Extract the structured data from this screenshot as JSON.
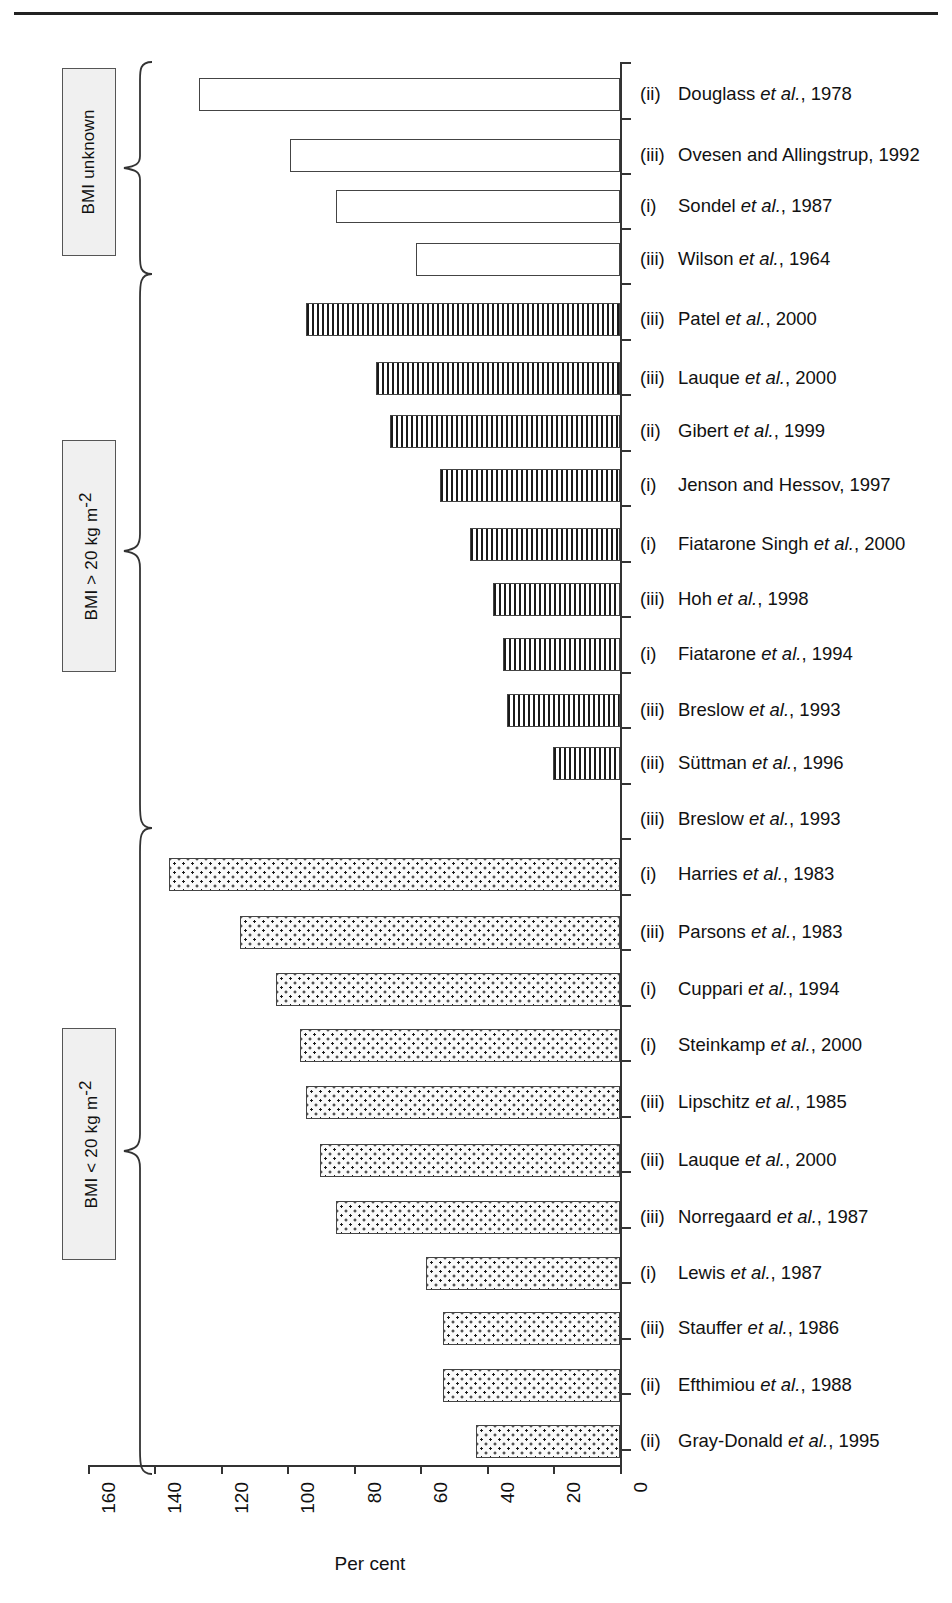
{
  "chart_data": {
    "type": "bar",
    "orientation": "horizontal",
    "title": "",
    "xlabel": "Per cent",
    "ylabel": "",
    "xlim": [
      160,
      0
    ],
    "x_axis_reversed": true,
    "xticks": [
      160,
      140,
      120,
      100,
      80,
      60,
      40,
      20,
      0
    ],
    "xticklabels": [
      "160",
      "140",
      "120",
      "100",
      "80",
      "60",
      "40",
      "20",
      "0"
    ],
    "grid": false,
    "legend": null,
    "groups": [
      {
        "id": "bmi-unknown",
        "label": "BMI unknown",
        "label_html": "BMI unknown",
        "fill": "open",
        "categories": [
          "(ii)  Douglass et al., 1978",
          "(iii) Ovesen and Allingstrup, 1992",
          "(i)   Sondel et al., 1987",
          "(iii) Wilson et al., 1964"
        ],
        "values": [
          126,
          99,
          85,
          61
        ]
      },
      {
        "id": "bmi-over-20",
        "label": "BMI > 20 kg m-2",
        "label_html": "BMI > 20 kg m<sup>-2</sup>",
        "fill": "vertical-lines",
        "categories": [
          "(iii) Patel et al., 2000",
          "(iii) Lauque et al., 2000",
          "(ii)  Gibert et al., 1999",
          "(i)   Jenson and Hessov, 1997",
          "(i)   Fiatarone Singh et al., 2000",
          "(iii) Hoh et al., 1998",
          "(i)   Fiatarone et al., 1994",
          "(iii) Breslow et al., 1993",
          "(iii) Süttman et al., 1996",
          "(iii) Breslow et al., 1993"
        ],
        "values": [
          94,
          73,
          69,
          54,
          45,
          38,
          35,
          34,
          20,
          0
        ]
      },
      {
        "id": "bmi-under-20",
        "label": "BMI < 20 kg m-2",
        "label_html": "BMI < 20 kg m<sup>-2</sup>",
        "fill": "dots",
        "categories": [
          "(i)   Harries et al., 1983",
          "(iii) Parsons et al., 1983",
          "(i)   Cuppari et al., 1994",
          "(i)   Steinkamp et al., 2000",
          "(iii) Lipschitz et al., 1985",
          "(iii) Lauque et al., 2000",
          "(iii) Norregaard et al., 1987",
          "(i)   Lewis et al., 1987",
          "(iii) Stauffer et al., 1986",
          "(ii)  Efthimiou et al., 1988",
          "(ii)  Gray-Donald et al., 1995"
        ],
        "values": [
          135,
          114,
          103,
          96,
          94,
          90,
          85,
          58,
          53,
          53,
          43
        ]
      }
    ]
  },
  "groups": [
    {
      "key": "unknown",
      "box_label_prefix": "BMI unknown",
      "box_label_suffix": "",
      "brace_top": 66,
      "brace_bottom": 268,
      "box_top": 68,
      "box_height": 186
    },
    {
      "key": "over20",
      "box_label_prefix": "BMI > 20 kg m",
      "box_label_suffix": "-2",
      "brace_top": 278,
      "brace_bottom": 822,
      "box_top": 440,
      "box_height": 230
    },
    {
      "key": "under20",
      "box_label_prefix": "BMI < 20 kg m",
      "box_label_suffix": "-2",
      "brace_top": 832,
      "brace_bottom": 1468,
      "box_top": 1028,
      "box_height": 230
    }
  ],
  "studies": [
    {
      "roman": "(ii)",
      "name": "Douglass ",
      "italic": "et al.",
      "year": ", 1978",
      "value": 126,
      "fill": "f-open",
      "y": 78
    },
    {
      "roman": "(iii)",
      "name": "Ovesen and Allingstrup",
      "italic": "",
      "year": ", 1992",
      "value": 99,
      "fill": "f-open",
      "y": 139
    },
    {
      "roman": "(i)",
      "name": "Sondel ",
      "italic": "et al.",
      "year": ", 1987",
      "value": 85,
      "fill": "f-open",
      "y": 190
    },
    {
      "roman": "(iii)",
      "name": "Wilson ",
      "italic": "et al.",
      "year": ", 1964",
      "value": 61,
      "fill": "f-open",
      "y": 243
    },
    {
      "roman": "(iii)",
      "name": "Patel ",
      "italic": "et al.",
      "year": ", 2000",
      "value": 94,
      "fill": "f-vline",
      "y": 303
    },
    {
      "roman": "(iii)",
      "name": "Lauque ",
      "italic": "et al.",
      "year": ", 2000",
      "value": 73,
      "fill": "f-vline",
      "y": 362
    },
    {
      "roman": "(ii)",
      "name": "Gibert ",
      "italic": "et al.",
      "year": ", 1999",
      "value": 69,
      "fill": "f-vline",
      "y": 415
    },
    {
      "roman": "(i)",
      "name": "Jenson and Hessov",
      "italic": "",
      "year": ", 1997",
      "value": 54,
      "fill": "f-vline",
      "y": 469
    },
    {
      "roman": "(i)",
      "name": "Fiatarone Singh ",
      "italic": "et al.",
      "year": ", 2000",
      "value": 45,
      "fill": "f-vline",
      "y": 528
    },
    {
      "roman": "(iii)",
      "name": "Hoh ",
      "italic": "et al.",
      "year": ", 1998",
      "value": 38,
      "fill": "f-vline",
      "y": 583
    },
    {
      "roman": "(i)",
      "name": "Fiatarone ",
      "italic": "et al.",
      "year": ", 1994",
      "value": 35,
      "fill": "f-vline",
      "y": 638
    },
    {
      "roman": "(iii)",
      "name": "Breslow ",
      "italic": "et al.",
      "year": ", 1993",
      "value": 34,
      "fill": "f-vline",
      "y": 694
    },
    {
      "roman": "(iii)",
      "name": "Süttman ",
      "italic": "et al.",
      "year": ", 1996",
      "value": 20,
      "fill": "f-vline",
      "y": 747
    },
    {
      "roman": "(iii)",
      "name": "Breslow ",
      "italic": "et al.",
      "year": ", 1993",
      "value": 0,
      "fill": "f-vline",
      "y": 803
    },
    {
      "roman": "(i)",
      "name": "Harries ",
      "italic": "et al.",
      "year": ", 1983",
      "value": 135,
      "fill": "f-dots",
      "y": 858
    },
    {
      "roman": "(iii)",
      "name": "Parsons ",
      "italic": "et al.",
      "year": ", 1983",
      "value": 114,
      "fill": "f-dots",
      "y": 916
    },
    {
      "roman": "(i)",
      "name": "Cuppari ",
      "italic": "et al.",
      "year": ", 1994",
      "value": 103,
      "fill": "f-dots",
      "y": 973
    },
    {
      "roman": "(i)",
      "name": "Steinkamp ",
      "italic": "et al.",
      "year": ", 2000",
      "value": 96,
      "fill": "f-dots",
      "y": 1029
    },
    {
      "roman": "(iii)",
      "name": "Lipschitz ",
      "italic": "et al.",
      "year": ", 1985",
      "value": 94,
      "fill": "f-dots",
      "y": 1086
    },
    {
      "roman": "(iii)",
      "name": "Lauque ",
      "italic": "et al.",
      "year": ", 2000",
      "value": 90,
      "fill": "f-dots",
      "y": 1144
    },
    {
      "roman": "(iii)",
      "name": "Norregaard ",
      "italic": "et al.",
      "year": ", 1987",
      "value": 85,
      "fill": "f-dots",
      "y": 1201
    },
    {
      "roman": "(i)",
      "name": "Lewis ",
      "italic": "et al.",
      "year": ", 1987",
      "value": 58,
      "fill": "f-dots",
      "y": 1257
    },
    {
      "roman": "(iii)",
      "name": "Stauffer ",
      "italic": "et al.",
      "year": ", 1986",
      "value": 53,
      "fill": "f-dots",
      "y": 1312
    },
    {
      "roman": "(ii)",
      "name": "Efthimiou ",
      "italic": "et al.",
      "year": ", 1988",
      "value": 53,
      "fill": "f-dots",
      "y": 1369
    },
    {
      "roman": "(ii)",
      "name": "Gray-Donald ",
      "italic": "et al.",
      "year": ", 1995",
      "value": 43,
      "fill": "f-dots",
      "y": 1425
    }
  ],
  "axis": {
    "title": "Per cent",
    "ticks": [
      "160",
      "140",
      "120",
      "100",
      "80",
      "60",
      "40",
      "20",
      "0"
    ]
  }
}
